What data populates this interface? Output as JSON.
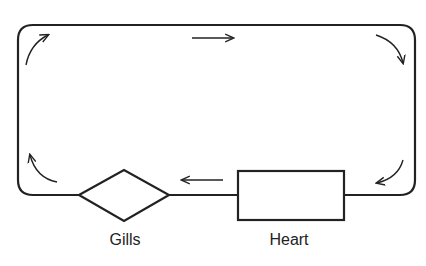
{
  "diagram": {
    "title": "",
    "type": "single-circulation loop (fish circulatory system)",
    "colors": {
      "stroke": "#222222",
      "background": "#ffffff"
    },
    "nodes": [
      {
        "id": "gills",
        "label": "Gills",
        "shape": "diamond"
      },
      {
        "id": "heart",
        "label": "Heart",
        "shape": "rectangle"
      }
    ],
    "flow": {
      "direction": "clockwise",
      "description": "Heart -> Gills -> body loop (left, top, right) -> back to Heart",
      "arrows": [
        {
          "id": "arrow-heart-to-gills",
          "direction": "left"
        },
        {
          "id": "arrow-bottom-left-corner",
          "direction": "up"
        },
        {
          "id": "arrow-top-left-corner",
          "direction": "right"
        },
        {
          "id": "arrow-top",
          "direction": "right"
        },
        {
          "id": "arrow-top-right-corner",
          "direction": "down"
        },
        {
          "id": "arrow-bottom-right-corner",
          "direction": "left"
        }
      ]
    }
  }
}
